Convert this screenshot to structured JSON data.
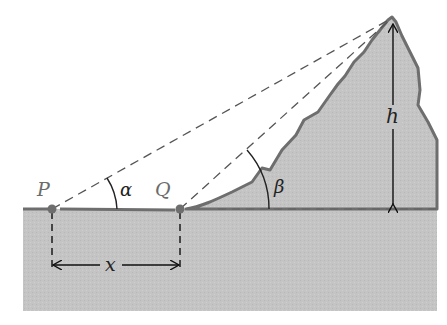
{
  "figure": {
    "labels": {
      "point_p": "P",
      "point_q": "Q",
      "angle_alpha": "α",
      "angle_beta": "β",
      "height": "h",
      "distance": "x"
    },
    "colors": {
      "ground_fill": "#c4c4c4",
      "mountain_outline": "#6e6e6e",
      "dashed_line": "#555555",
      "arrow": "#111111",
      "point_marker": "#6e6e6e"
    }
  }
}
